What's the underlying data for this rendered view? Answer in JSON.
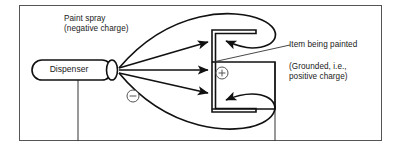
{
  "figure": {
    "kind": "electrostatic-painting-diagram",
    "frame": {
      "x": 19,
      "y": 5,
      "width": 363,
      "height": 136
    },
    "stroke_color": "#1a1a1a",
    "background_color": "#ffffff"
  },
  "labels": {
    "paint_spray": "Paint spray\n(negative charge)",
    "dispenser": "Dispenser",
    "item_being_painted": "Item being painted",
    "grounded": "(Grounded, i.e.,\npositive charge)"
  },
  "symbols": {
    "negative_charge": "−",
    "positive_charge": "+",
    "negative_pos": {
      "cx": 133,
      "cy": 96,
      "r": 6
    },
    "positive_pos": {
      "cx": 222,
      "cy": 73,
      "r": 6
    }
  },
  "dispenser": {
    "body": {
      "x": 32,
      "y": 60,
      "width": 80,
      "height": 20,
      "rx": 10
    },
    "nozzle": {
      "cx": 112,
      "cy": 70,
      "rx": 5.5,
      "ry": 10
    },
    "spray_origin": {
      "x": 118,
      "y": 70
    }
  },
  "item": {
    "shape": "squared-C bracket opening left",
    "left_face_x": 212,
    "right_edge_x": 275,
    "top_arm_y": 33,
    "bottom_arm_y": 109,
    "arm_tip_x": 256
  },
  "stand_lines": [
    {
      "x": 78,
      "y1": 80,
      "y2": 141
    },
    {
      "x": 275,
      "y1": 62,
      "y2": 141
    }
  ],
  "straight_arrows": [
    {
      "from": [
        118,
        70
      ],
      "to": [
        212,
        42
      ]
    },
    {
      "from": [
        118,
        70
      ],
      "to": [
        212,
        70
      ]
    },
    {
      "from": [
        118,
        70
      ],
      "to": [
        212,
        93
      ]
    }
  ],
  "wrap_arrows": [
    {
      "name": "top-wrap",
      "tip": [
        222,
        41
      ],
      "direction": "left"
    },
    {
      "name": "bottom-wrap",
      "tip": [
        222,
        100
      ],
      "direction": "left"
    }
  ],
  "leader_line": {
    "from": [
      213,
      62
    ],
    "to": [
      290,
      45
    ]
  }
}
